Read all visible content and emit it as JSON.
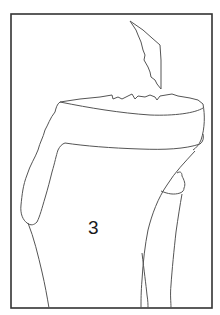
{
  "figure": {
    "label": "3",
    "label_position": {
      "x": 86,
      "y": 220
    },
    "frame": {
      "x": 11,
      "y": 14,
      "width": 201,
      "height": 294
    },
    "colors": {
      "background": "#ffffff",
      "frame_stroke": "#333333",
      "line_stroke": "#555555",
      "label_color": "#1a1a1a"
    },
    "parts": [
      {
        "name": "bone-fragment",
        "description": "detached jagged bone fragment above plateau"
      },
      {
        "name": "tibial-plateau",
        "description": "top articular surface with jagged fracture edge"
      },
      {
        "name": "tibia-shaft",
        "description": "main bone shaft"
      },
      {
        "name": "fibula",
        "description": "thin bone on the right with head"
      }
    ]
  }
}
